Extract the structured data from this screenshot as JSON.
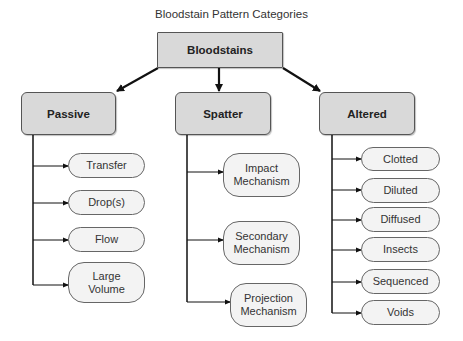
{
  "title": "Bloodstain Pattern Categories",
  "root": {
    "label": "Bloodstains"
  },
  "categories": [
    {
      "label": "Passive",
      "children": [
        "Transfer",
        "Drop(s)",
        "Flow",
        "Large\nVolume"
      ]
    },
    {
      "label": "Spatter",
      "children": [
        "Impact\nMechanism",
        "Secondary\nMechanism",
        "Projection\nMechanism"
      ]
    },
    {
      "label": "Altered",
      "children": [
        "Clotted",
        "Diluted",
        "Diffused",
        "Insects",
        "Sequenced",
        "Voids"
      ]
    }
  ],
  "colors": {
    "category_fill": "#d9d9d9",
    "leaf_fill": "#f3f3f3",
    "line": "#111111"
  }
}
